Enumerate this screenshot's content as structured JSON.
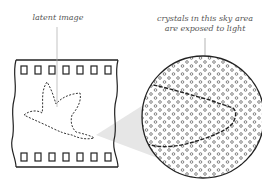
{
  "diagram": {
    "labels": {
      "latent_image": "latent image",
      "crystals_line1": "crystals in this sky area",
      "crystals_line2": "are exposed to light"
    },
    "elements": {
      "film_strip": {
        "sprocket_holes_top": 7,
        "sprocket_holes_bottom": 7,
        "content": "dashed outline of a bird (latent image)"
      },
      "magnifier_circle": {
        "content": "dot pattern of silver halide crystals with dashed bird outline edge",
        "crystal_marker": "small open circles"
      },
      "magnification_wedge": {
        "color": "#e6e6e6"
      }
    },
    "colors": {
      "line": "#222222",
      "leader": "#aaaaaa",
      "text": "#555555",
      "wedge": "#e6e6e6",
      "crystal": "#666666"
    }
  }
}
